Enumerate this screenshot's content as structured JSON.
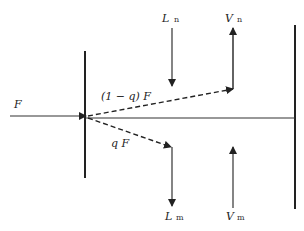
{
  "diagram": {
    "feed_label": "F",
    "upper_split_label": "(1 − q) F",
    "lower_split_label": "q F",
    "upper_liquid": {
      "symbol": "L",
      "subscript": "n"
    },
    "upper_vapor": {
      "symbol": "V",
      "subscript": "n"
    },
    "lower_liquid": {
      "symbol": "L",
      "subscript": "m"
    },
    "lower_vapor": {
      "symbol": "V",
      "subscript": "m"
    }
  }
}
